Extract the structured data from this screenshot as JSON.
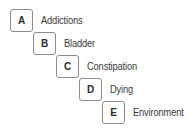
{
  "diagram": {
    "type": "staircase-index-list",
    "background_color": "#ffffff",
    "box_border_color": "#8c8c8c",
    "box_fill_color": "#ffffff",
    "letter_color": "#2b2b2b",
    "label_color": "#3a3a3a",
    "rows": [
      {
        "key": "A",
        "label": "Addictions",
        "x": 10,
        "y": 9
      },
      {
        "key": "B",
        "label": "Bladder",
        "x": 33,
        "y": 32
      },
      {
        "key": "C",
        "label": "Constipation",
        "x": 56,
        "y": 55
      },
      {
        "key": "D",
        "label": "Dying",
        "x": 79,
        "y": 78
      },
      {
        "key": "E",
        "label": "Environment",
        "x": 102,
        "y": 101
      }
    ]
  }
}
